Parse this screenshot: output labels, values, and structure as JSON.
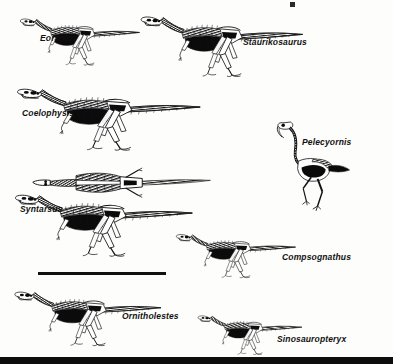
{
  "figure": {
    "kind": "scientific-plate",
    "background_color": "#fdfdfb",
    "ink_color": "#111111",
    "width": 393,
    "height": 364
  },
  "specimens": [
    {
      "id": "eoraptor",
      "label": "Eoraptor",
      "label_x": 40,
      "label_y": 38,
      "pose": "lateral-running-left",
      "origin_x": 18,
      "origin_y": 12,
      "scale": 0.62,
      "tail_length": 1.0
    },
    {
      "id": "staurikosaurus",
      "label": "Staurikosaurus",
      "label_x": 243,
      "label_y": 42,
      "pose": "lateral-running-left",
      "origin_x": 138,
      "origin_y": 8,
      "scale": 0.82,
      "tail_length": 1.25
    },
    {
      "id": "coelophysis",
      "label": "Coelophysis",
      "label_x": 22,
      "label_y": 112,
      "pose": "lateral-running-left",
      "origin_x": 14,
      "origin_y": 80,
      "scale": 0.95,
      "tail_length": 1.3
    },
    {
      "id": "pelecyornis",
      "label": "Pelecyornis",
      "label_x": 302,
      "label_y": 140,
      "pose": "bird-standing",
      "origin_x": 272,
      "origin_y": 118,
      "scale": 0.78,
      "tail_length": 0.25
    },
    {
      "id": "syntarsus-dorsal",
      "label": "",
      "label_x": 0,
      "label_y": 0,
      "pose": "dorsal-top-view",
      "origin_x": 30,
      "origin_y": 168,
      "scale": 0.9,
      "tail_length": 1.1
    },
    {
      "id": "syntarsus",
      "label": "Syntarsus",
      "label_x": 20,
      "label_y": 208,
      "pose": "lateral-running-left",
      "origin_x": 12,
      "origin_y": 186,
      "scale": 0.9,
      "tail_length": 1.3
    },
    {
      "id": "compsognathus",
      "label": "Compsognathus",
      "label_x": 282,
      "label_y": 256,
      "pose": "lateral-running-left",
      "origin_x": 174,
      "origin_y": 228,
      "scale": 0.6,
      "tail_length": 1.35
    },
    {
      "id": "ornitholestes",
      "label": "Ornitholestes",
      "label_x": 122,
      "label_y": 315,
      "pose": "lateral-running-left",
      "origin_x": 12,
      "origin_y": 284,
      "scale": 0.72,
      "tail_length": 1.3
    },
    {
      "id": "sinosauropteryx",
      "label": "Sinosauropteryx",
      "label_x": 277,
      "label_y": 338,
      "pose": "lateral-running-left",
      "origin_x": 196,
      "origin_y": 310,
      "scale": 0.52,
      "tail_length": 1.35
    }
  ],
  "scale_bar": {
    "label": "",
    "x": 38,
    "y": 272,
    "width": 128,
    "thickness": 3,
    "color": "#111111"
  },
  "bottom_strip": {
    "y": 357,
    "height": 7,
    "color": "#0d0d0d"
  },
  "top_fleck": {
    "x": 290,
    "y": 2,
    "width": 5,
    "height": 5,
    "color": "#2a2a2a"
  }
}
